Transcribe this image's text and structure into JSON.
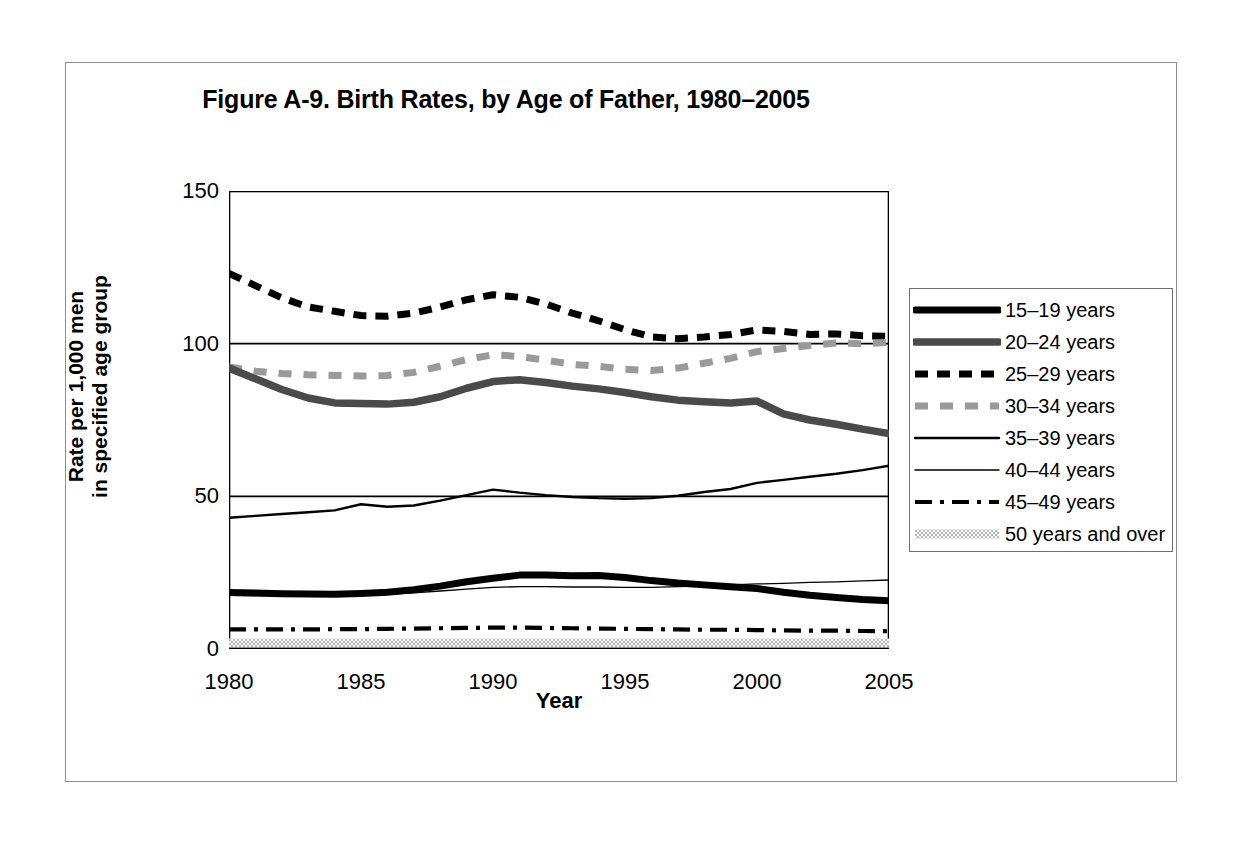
{
  "figure": {
    "title": "Figure A-9. Birth Rates, by Age of Father, 1980–2005",
    "x_axis_title": "Year",
    "y_axis_title_line1": "Rate per 1,000 men",
    "y_axis_title_line2": "in specified age group"
  },
  "chart_data": {
    "type": "line",
    "title": "Figure A-9. Birth Rates, by Age of Father, 1980–2005",
    "xlabel": "Year",
    "ylabel": "Rate per 1,000 men in specified age group",
    "xlim": [
      1980,
      2005
    ],
    "ylim": [
      0,
      150
    ],
    "ytick_labels": [
      "0",
      "50",
      "100",
      "150"
    ],
    "yticks": [
      0,
      50,
      100,
      150
    ],
    "xtick_labels": [
      "1980",
      "1985",
      "1990",
      "1995",
      "2000",
      "2005"
    ],
    "xticks": [
      1980,
      1985,
      1990,
      1995,
      2000,
      2005
    ],
    "grid": "horizontal-major",
    "legend_position": "right",
    "x": [
      1980,
      1981,
      1982,
      1983,
      1984,
      1985,
      1986,
      1987,
      1988,
      1989,
      1990,
      1991,
      1992,
      1993,
      1994,
      1995,
      1996,
      1997,
      1998,
      1999,
      2000,
      2001,
      2002,
      2003,
      2004,
      2005
    ],
    "series": [
      {
        "name": "15–19 years",
        "style": "solid-thick-black",
        "color": "#000000",
        "values": [
          18.5,
          18.3,
          18.1,
          18.0,
          17.9,
          18.2,
          18.6,
          19.4,
          20.6,
          22.0,
          23.2,
          24.2,
          24.2,
          24.0,
          24.1,
          23.4,
          22.4,
          21.6,
          21.0,
          20.4,
          19.8,
          18.6,
          17.6,
          16.9,
          16.2,
          15.8
        ]
      },
      {
        "name": "20–24 years",
        "style": "solid-thick-gray",
        "color": "#4a4a4a",
        "values": [
          92.0,
          88.5,
          85.0,
          82.2,
          80.6,
          80.4,
          80.2,
          80.8,
          82.6,
          85.4,
          87.6,
          88.2,
          87.3,
          86.1,
          85.2,
          84.0,
          82.6,
          81.5,
          81.0,
          80.6,
          81.2,
          77.0,
          75.0,
          73.6,
          72.0,
          70.6
        ]
      },
      {
        "name": "25–29 years",
        "style": "dashed-black",
        "color": "#000000",
        "values": [
          123.0,
          119.0,
          115.0,
          112.0,
          110.6,
          109.2,
          109.0,
          110.0,
          112.0,
          114.4,
          116.0,
          115.2,
          113.0,
          110.0,
          107.5,
          104.6,
          102.2,
          101.6,
          102.2,
          103.0,
          104.5,
          104.0,
          103.0,
          103.2,
          102.6,
          102.4
        ]
      },
      {
        "name": "30–34 years",
        "style": "dashed-gray",
        "color": "#9a9a9a",
        "values": [
          92.4,
          91.0,
          90.2,
          89.8,
          89.6,
          89.4,
          89.6,
          90.6,
          92.6,
          94.8,
          96.4,
          95.8,
          94.6,
          93.2,
          92.6,
          91.6,
          91.2,
          92.0,
          93.6,
          95.2,
          97.4,
          98.4,
          99.4,
          100.2,
          100.0,
          100.4
        ]
      },
      {
        "name": "35–39 years",
        "style": "solid-medium-black",
        "color": "#000000",
        "values": [
          43.0,
          43.6,
          44.2,
          44.8,
          45.4,
          47.4,
          46.6,
          47.0,
          48.6,
          50.4,
          52.2,
          51.2,
          50.4,
          49.8,
          49.4,
          49.2,
          49.4,
          50.2,
          51.4,
          52.4,
          54.4,
          55.4,
          56.4,
          57.4,
          58.6,
          60.0
        ]
      },
      {
        "name": "40–44 years",
        "style": "solid-thin-black",
        "color": "#000000",
        "values": [
          17.6,
          17.5,
          17.5,
          17.5,
          17.6,
          17.8,
          18.0,
          18.4,
          19.0,
          19.6,
          20.2,
          20.4,
          20.4,
          20.3,
          20.3,
          20.2,
          20.2,
          20.4,
          20.7,
          21.0,
          21.3,
          21.5,
          21.8,
          22.0,
          22.3,
          22.6
        ]
      },
      {
        "name": "45–49 years",
        "style": "dash-dot-black",
        "color": "#000000",
        "values": [
          6.4,
          6.4,
          6.4,
          6.4,
          6.5,
          6.5,
          6.6,
          6.7,
          6.8,
          6.9,
          7.0,
          7.0,
          6.9,
          6.8,
          6.7,
          6.6,
          6.5,
          6.4,
          6.3,
          6.3,
          6.2,
          6.1,
          6.0,
          6.0,
          5.9,
          5.8
        ]
      },
      {
        "name": "50 years and over",
        "style": "dotted-band-gray",
        "color": "#b4b4b4",
        "values": [
          2.0,
          2.0,
          2.0,
          2.0,
          2.0,
          2.0,
          2.0,
          2.0,
          2.0,
          2.0,
          2.0,
          2.0,
          2.0,
          2.0,
          2.0,
          2.0,
          2.0,
          2.0,
          2.0,
          2.0,
          2.0,
          2.0,
          2.0,
          2.0,
          2.0,
          2.0
        ]
      }
    ]
  }
}
